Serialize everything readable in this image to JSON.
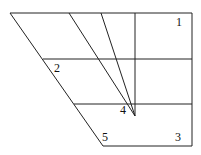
{
  "diagram": {
    "labels": [
      {
        "id": "1",
        "text": "1",
        "x": 176,
        "y": 16
      },
      {
        "id": "2",
        "text": "2",
        "x": 54,
        "y": 62
      },
      {
        "id": "3",
        "text": "3",
        "x": 175,
        "y": 131
      },
      {
        "id": "4",
        "text": "4",
        "x": 120,
        "y": 104
      },
      {
        "id": "5",
        "text": "5",
        "x": 102,
        "y": 131
      }
    ],
    "stroke_color": "#222222"
  }
}
